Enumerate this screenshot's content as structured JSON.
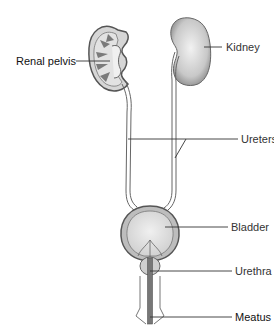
{
  "diagram": {
    "labels": {
      "renal_pelvis": "Renal pelvis",
      "kidney": "Kidney",
      "ureters": "Ureters",
      "bladder": "Bladder",
      "urethra": "Urethra",
      "meatus": "Meatus"
    },
    "colors": {
      "outline": "#555555",
      "organ_fill": "#d4d4d4",
      "organ_highlight": "#eeeeee",
      "leader_line": "#333333",
      "text": "#333333"
    }
  }
}
